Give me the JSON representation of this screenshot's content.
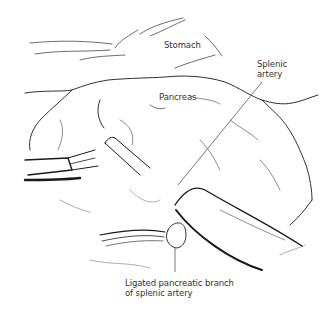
{
  "figure": {
    "type": "surgical anatomical line illustration",
    "labels": {
      "stomach": "Stomach",
      "pancreas": "Pancreas",
      "splenic_artery_line1": "Splenic",
      "splenic_artery_line2": "artery",
      "ligated_line1": "Ligated pancreatic branch",
      "ligated_line2": "of splenic artery"
    },
    "colors": {
      "ink": "#1a1a1a",
      "label_text": "#333333",
      "leader_line": "#555555",
      "background": "#ffffff"
    }
  }
}
